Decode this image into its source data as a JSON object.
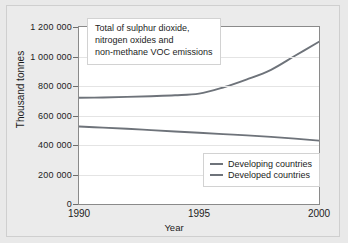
{
  "chart_data": {
    "type": "line",
    "title": "Total of sulphur dioxide,\nnitrogen oxides and\nnon-methane VOC emissions",
    "xlabel": "Year",
    "ylabel": "Thousand tonnes",
    "xlim": [
      1990,
      2000
    ],
    "ylim": [
      0,
      1200000
    ],
    "grid": true,
    "legend_position": "lower right",
    "xticks": [
      "1990",
      "1995",
      "2000"
    ],
    "xtick_values": [
      1990,
      1995,
      2000
    ],
    "yticks": [
      "0",
      "200 000",
      "400 000",
      "600 000",
      "800 000",
      "1 000 000",
      "1 200 000"
    ],
    "ytick_values": [
      0,
      200000,
      400000,
      600000,
      800000,
      1000000,
      1200000
    ],
    "x": [
      1990,
      1991,
      1992,
      1993,
      1994,
      1995,
      1996,
      1997,
      1998,
      1999,
      2000
    ],
    "series": [
      {
        "name": "Developing countries",
        "color": "#6e737a",
        "values": [
          720000,
          722000,
          726000,
          731000,
          737000,
          748000,
          790000,
          845000,
          910000,
          1005000,
          1100000
        ]
      },
      {
        "name": "Developed countries",
        "color": "#6e737a",
        "values": [
          525000,
          518000,
          510000,
          501000,
          492000,
          483000,
          474000,
          465000,
          455000,
          443000,
          430000
        ]
      }
    ]
  },
  "colors": {
    "figure_background": "#ebebeb",
    "plot_background": "#ffffff",
    "axis": "#8a8a8a",
    "gridline": "#e4e4e4",
    "text": "#1c1c1c",
    "line": "#6e737a"
  }
}
